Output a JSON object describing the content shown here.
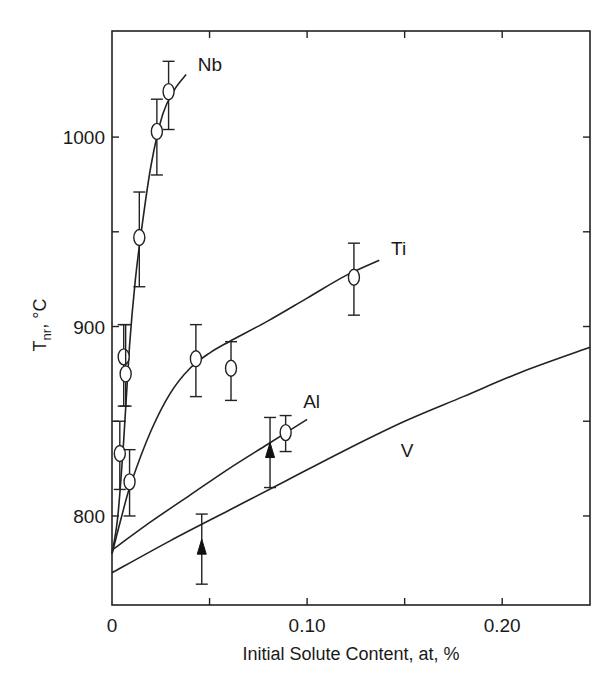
{
  "chart_data": {
    "type": "scatter",
    "title": "",
    "xlabel": "Initial Solute Content, at, %",
    "ylabel_main": "T",
    "ylabel_sub": "nr",
    "ylabel_unit": ", °C",
    "ylabel": "T_nr, °C",
    "xlim": [
      0,
      0.245
    ],
    "ylim": [
      753,
      1056
    ],
    "grid": false,
    "legend": "inline labels",
    "x_ticks": [
      {
        "value": 0,
        "label": "0"
      },
      {
        "value": 0.05,
        "label": ""
      },
      {
        "value": 0.1,
        "label": "0.10"
      },
      {
        "value": 0.15,
        "label": ""
      },
      {
        "value": 0.2,
        "label": "0.20"
      }
    ],
    "y_ticks": [
      {
        "value": 800,
        "label": "800"
      },
      {
        "value": 850,
        "label": ""
      },
      {
        "value": 900,
        "label": "900"
      },
      {
        "value": 950,
        "label": ""
      },
      {
        "value": 1000,
        "label": "1000"
      }
    ],
    "series": [
      {
        "name": "Nb",
        "label": "Nb",
        "label_pos": [
          0.044,
          1035
        ],
        "marker": "circle",
        "points": [
          {
            "x": 0.006,
            "y": 884,
            "err_lo": 858,
            "err_hi": 901
          },
          {
            "x": 0.007,
            "y": 875,
            "err_lo": 858,
            "err_hi": 901
          },
          {
            "x": 0.014,
            "y": 947,
            "err_lo": 921,
            "err_hi": 971
          },
          {
            "x": 0.023,
            "y": 1003,
            "err_lo": 980,
            "err_hi": 1020
          },
          {
            "x": 0.029,
            "y": 1024,
            "err_lo": 1004,
            "err_hi": 1040
          }
        ],
        "curve": [
          [
            0,
            780
          ],
          [
            0.003,
            800
          ],
          [
            0.006,
            840
          ],
          [
            0.009,
            890
          ],
          [
            0.012,
            925
          ],
          [
            0.015,
            950
          ],
          [
            0.02,
            985
          ],
          [
            0.026,
            1012
          ],
          [
            0.032,
            1025
          ],
          [
            0.038,
            1033
          ]
        ]
      },
      {
        "name": "Ti",
        "label": "Ti",
        "label_pos": [
          0.143,
          938
        ],
        "marker": "circle",
        "points": [
          {
            "x": 0.004,
            "y": 833,
            "err_lo": 814,
            "err_hi": 850
          },
          {
            "x": 0.009,
            "y": 818,
            "err_lo": 800,
            "err_hi": 835
          },
          {
            "x": 0.043,
            "y": 883,
            "err_lo": 863,
            "err_hi": 901
          },
          {
            "x": 0.061,
            "y": 878,
            "err_lo": 861,
            "err_hi": 892
          },
          {
            "x": 0.124,
            "y": 926,
            "err_lo": 906,
            "err_hi": 944
          }
        ],
        "curve": [
          [
            0,
            780
          ],
          [
            0.005,
            800
          ],
          [
            0.01,
            818
          ],
          [
            0.02,
            845
          ],
          [
            0.03,
            865
          ],
          [
            0.04,
            878
          ],
          [
            0.05,
            886
          ],
          [
            0.06,
            892
          ],
          [
            0.08,
            903
          ],
          [
            0.1,
            915
          ],
          [
            0.12,
            927
          ],
          [
            0.137,
            935
          ]
        ]
      },
      {
        "name": "Al",
        "label": "Al",
        "label_pos": [
          0.098,
          857
        ],
        "marker": "circle",
        "points": [
          {
            "x": 0.089,
            "y": 844,
            "err_lo": 834,
            "err_hi": 853
          }
        ],
        "curve": [
          [
            0,
            782
          ],
          [
            0.02,
            797
          ],
          [
            0.04,
            811
          ],
          [
            0.06,
            825
          ],
          [
            0.08,
            838
          ],
          [
            0.1,
            851
          ]
        ]
      },
      {
        "name": "V",
        "label": "V",
        "label_pos": [
          0.148,
          831
        ],
        "marker": "triangle",
        "points": [
          {
            "x": 0.046,
            "y": 783,
            "err_lo": 764,
            "err_hi": 801
          },
          {
            "x": 0.081,
            "y": 834,
            "err_lo": 815,
            "err_hi": 852
          }
        ],
        "curve": [
          [
            0,
            770
          ],
          [
            0.03,
            787
          ],
          [
            0.06,
            803
          ],
          [
            0.09,
            819
          ],
          [
            0.12,
            835
          ],
          [
            0.15,
            850
          ],
          [
            0.18,
            863
          ],
          [
            0.21,
            876
          ],
          [
            0.245,
            889
          ]
        ]
      }
    ]
  }
}
